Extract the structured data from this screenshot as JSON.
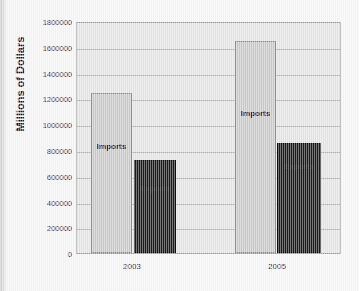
{
  "chart_data": {
    "type": "bar",
    "title": "",
    "xlabel": "",
    "ylabel": "Millions of Dollars",
    "categories": [
      "2003",
      "2005"
    ],
    "series": [
      {
        "name": "Imports",
        "values": [
          1255000,
          1660000
        ],
        "color": "#c9c9c9"
      },
      {
        "name": "Exports",
        "values": [
          729000,
          860000
        ],
        "color": "#1b1b1b"
      }
    ],
    "ylim": [
      0,
      1800000
    ],
    "ytick_labels": [
      "1800000",
      "1600000",
      "1400000",
      "1200000",
      "1000000",
      "800000",
      "600000",
      "400000",
      "200000",
      "0"
    ],
    "ytick_values": [
      1800000,
      1600000,
      1400000,
      1200000,
      1000000,
      800000,
      600000,
      400000,
      200000,
      0
    ],
    "grid": true,
    "legend": "inline-bar-labels",
    "bar_labels": [
      {
        "text": "Imports",
        "category": "2003"
      },
      {
        "text": "Exports",
        "category": "2003"
      },
      {
        "text": "Imports",
        "category": "2005"
      },
      {
        "text": "Exports",
        "category": "2005"
      }
    ],
    "plot_background": "#e4e4e4",
    "figure_background": "#f4f4f4"
  }
}
